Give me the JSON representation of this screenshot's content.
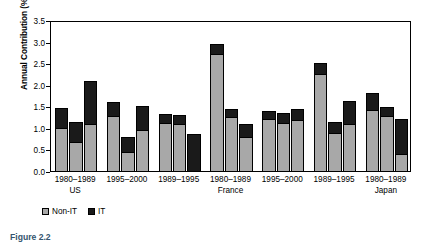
{
  "chart_data": {
    "type": "bar",
    "subtype": "stacked-grouped",
    "title": "",
    "xlabel": "",
    "ylabel": "Annual Contribution (%)",
    "ylim": [
      0.0,
      3.5
    ],
    "yticks": [
      "0.0",
      "0.5",
      "1.0",
      "1.5",
      "2.0",
      "2.5",
      "3.0",
      "3.5"
    ],
    "ytick_values": [
      0.0,
      0.5,
      1.0,
      1.5,
      2.0,
      2.5,
      3.0,
      3.5
    ],
    "grid": false,
    "legend_position": "below-axes-left",
    "series": [
      {
        "name": "Non-IT",
        "color": "#a8a8a8"
      },
      {
        "name": "IT",
        "color": "#1a1a1a"
      }
    ],
    "categories": [
      "1980–1989",
      "1995–2000",
      "1989–1995",
      "1980–1989",
      "1995–2000",
      "1989–1995",
      "1980–1989"
    ],
    "country_labels": [
      "US",
      "",
      "",
      "France",
      "",
      "",
      "Japan"
    ],
    "groups": [
      {
        "period": "1980–1989",
        "country": "US",
        "bars": [
          {
            "non_it": 1.0,
            "it": 0.45,
            "total": 1.45
          },
          {
            "non_it": 0.68,
            "it": 0.45,
            "total": 1.13
          },
          {
            "non_it": 1.08,
            "it": 1.0,
            "total": 2.08
          }
        ]
      },
      {
        "period": "1995–2000",
        "country": "",
        "bars": [
          {
            "non_it": 1.28,
            "it": 0.33,
            "total": 1.61
          },
          {
            "non_it": 0.45,
            "it": 0.35,
            "total": 0.8
          },
          {
            "non_it": 0.95,
            "it": 0.55,
            "total": 1.5
          }
        ]
      },
      {
        "period": "1989–1995",
        "country": "",
        "bars": [
          {
            "non_it": 1.12,
            "it": 0.2,
            "total": 1.32
          },
          {
            "non_it": 1.08,
            "it": 0.22,
            "total": 1.3
          },
          {
            "non_it": 0.0,
            "it": 0.85,
            "total": 0.85
          }
        ]
      },
      {
        "period": "1980–1989",
        "country": "France",
        "bars": [
          {
            "non_it": 2.72,
            "it": 0.22,
            "total": 2.94
          },
          {
            "non_it": 1.25,
            "it": 0.18,
            "total": 1.43
          },
          {
            "non_it": 0.78,
            "it": 0.3,
            "total": 1.08
          }
        ]
      },
      {
        "period": "1995–2000",
        "country": "",
        "bars": [
          {
            "non_it": 1.2,
            "it": 0.2,
            "total": 1.4
          },
          {
            "non_it": 1.12,
            "it": 0.22,
            "total": 1.34
          },
          {
            "non_it": 1.18,
            "it": 0.25,
            "total": 1.43
          }
        ]
      },
      {
        "period": "1989–1995",
        "country": "",
        "bars": [
          {
            "non_it": 2.25,
            "it": 0.25,
            "total": 2.5
          },
          {
            "non_it": 0.88,
            "it": 0.25,
            "total": 1.13
          },
          {
            "non_it": 1.1,
            "it": 0.52,
            "total": 1.62
          }
        ]
      },
      {
        "period": "1980–1989",
        "country": "Japan",
        "bars": [
          {
            "non_it": 1.42,
            "it": 0.4,
            "total": 1.82
          },
          {
            "non_it": 1.28,
            "it": 0.2,
            "total": 1.48
          },
          {
            "non_it": 0.4,
            "it": 0.8,
            "total": 1.2
          }
        ]
      }
    ]
  },
  "legend": {
    "items": [
      {
        "label": "Non-IT",
        "color": "#a8a8a8"
      },
      {
        "label": "IT",
        "color": "#1a1a1a"
      }
    ]
  },
  "caption": {
    "text": "Figure 2.2"
  },
  "colors": {
    "non_it": "#a8a8a8",
    "it": "#1a1a1a",
    "axis": "#000000",
    "caption": "#33546e",
    "background": "#ffffff"
  }
}
